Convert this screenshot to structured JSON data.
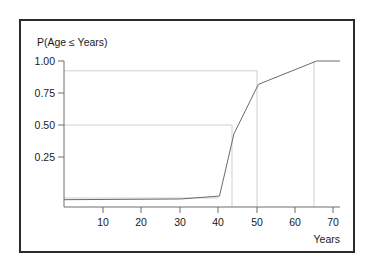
{
  "figure": {
    "background_color": "#ffffff",
    "frame_color": "#2b2b2b",
    "axis_color": "#6e6e6e",
    "curve_color": "#6b6b6b",
    "reference_line_color": "#cfcfcf"
  },
  "chart_data": {
    "type": "line",
    "title": "",
    "ylabel": "P(Age ≤ Years)",
    "xlabel": "Years",
    "xlim": [
      0,
      71
    ],
    "ylim": [
      0,
      1.06
    ],
    "grid": false,
    "legend": null,
    "xticks": [
      10,
      20,
      30,
      40,
      50,
      60,
      70
    ],
    "xticklabels": [
      "10",
      "20",
      "30",
      "40",
      "50",
      "60",
      "70"
    ],
    "yticks": [
      0.25,
      0.5,
      0.75,
      1.0
    ],
    "yticklabels": [
      "0.25",
      "0.50",
      "0.75",
      "1.00"
    ],
    "series": [
      {
        "name": "Empirical CDF of Age",
        "x": [
          0,
          30,
          40,
          43.7,
          50,
          65,
          71
        ],
        "values": [
          0.05,
          0.055,
          0.075,
          0.5,
          0.84,
          1.0,
          1.0
        ]
      }
    ],
    "annotations": [
      {
        "type": "reference-horizontal",
        "y": 0.84,
        "x_from": 0,
        "x_to": 50,
        "label": "0.84"
      },
      {
        "type": "reference-vertical",
        "x": 50,
        "y_from": 0,
        "y_to": 0.84,
        "label": "50"
      },
      {
        "type": "reference-horizontal",
        "y": 0.5,
        "x_from": 0,
        "x_to": 43.7,
        "label": "0.50"
      },
      {
        "type": "reference-vertical",
        "x": 43.7,
        "y_from": 0,
        "y_to": 0.5,
        "label": "43.7"
      },
      {
        "type": "reference-horizontal",
        "y": 0.07,
        "x_from": 0,
        "x_to": 40,
        "label": "0.07"
      },
      {
        "type": "reference-vertical",
        "x": 65,
        "y_from": 0,
        "y_to": 1.0,
        "label": "65"
      }
    ]
  }
}
